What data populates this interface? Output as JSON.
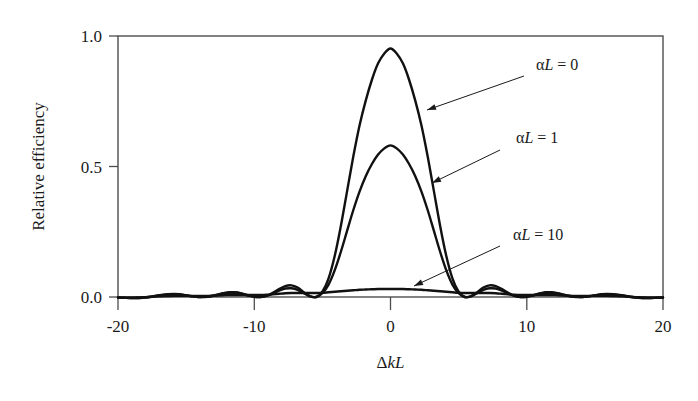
{
  "chart_data": {
    "type": "line",
    "title": "",
    "xlabel": "ΔkL",
    "ylabel": "Relative efficiency",
    "xlim": [
      -20,
      20
    ],
    "ylim": [
      0.0,
      1.05
    ],
    "grid": false,
    "legend_position": "inline-annotations",
    "x_ticks": [
      "-20",
      "-10",
      "0",
      "10",
      "20"
    ],
    "x_tick_values": [
      -20,
      -10,
      0,
      10,
      20
    ],
    "y_ticks": [
      "0.0",
      "0.5",
      "1.0"
    ],
    "y_tick_values": [
      0.0,
      0.5,
      1.0
    ],
    "series": [
      {
        "name": "αL = 0",
        "alpha_L": 0,
        "peak_value": 1.0,
        "peak_x": 0,
        "first_null_x": 6.28,
        "sidelobe_peaks": [
          0.047,
          0.017,
          0.008
        ],
        "description": "sinc^2(ΔkL/2) lossless phase-matching curve",
        "values": [
          -0.002,
          -0.003,
          -0.004,
          -0.004,
          -0.003,
          0.0,
          0.004,
          0.008,
          0.011,
          0.012,
          0.011,
          0.007,
          0.003,
          0.0,
          0.0,
          0.003,
          0.009,
          0.015,
          0.019,
          0.019,
          0.014,
          0.007,
          0.001,
          0.0,
          0.005,
          0.017,
          0.032,
          0.044,
          0.047,
          0.038,
          0.019,
          0.003,
          0.0,
          0.021,
          0.075,
          0.166,
          0.288,
          0.427,
          0.566,
          0.69,
          0.79,
          0.874,
          0.94,
          0.98,
          1.0,
          0.98,
          0.94,
          0.874,
          0.79,
          0.69,
          0.566,
          0.427,
          0.288,
          0.166,
          0.075,
          0.021,
          0.0,
          0.003,
          0.019,
          0.038,
          0.047,
          0.044,
          0.032,
          0.017,
          0.005,
          0.0,
          0.001,
          0.007,
          0.014,
          0.019,
          0.019,
          0.015,
          0.009,
          0.003,
          0.0,
          0.0,
          0.003,
          0.007,
          0.011,
          0.012,
          0.011,
          0.008,
          0.004,
          0.0,
          -0.003,
          -0.004,
          -0.004,
          -0.003,
          -0.002
        ]
      },
      {
        "name": "αL = 1",
        "alpha_L": 1,
        "peak_value": 0.61,
        "peak_x": 0,
        "first_null_x": 6.5,
        "sidelobe_peaks": [
          0.035,
          0.014,
          0.007
        ],
        "description": "moderately absorbing medium, peak reduced to ~0.61",
        "values": [
          -0.002,
          -0.003,
          -0.004,
          -0.004,
          -0.002,
          0.0,
          0.004,
          0.007,
          0.009,
          0.01,
          0.009,
          0.006,
          0.003,
          0.0,
          0.001,
          0.003,
          0.008,
          0.013,
          0.016,
          0.016,
          0.012,
          0.006,
          0.001,
          0.0,
          0.005,
          0.014,
          0.026,
          0.034,
          0.035,
          0.029,
          0.015,
          0.003,
          0.0,
          0.015,
          0.05,
          0.108,
          0.183,
          0.267,
          0.35,
          0.424,
          0.486,
          0.535,
          0.573,
          0.598,
          0.61,
          0.598,
          0.573,
          0.535,
          0.486,
          0.424,
          0.35,
          0.267,
          0.183,
          0.108,
          0.05,
          0.015,
          0.0,
          0.003,
          0.015,
          0.029,
          0.035,
          0.034,
          0.026,
          0.014,
          0.005,
          0.0,
          0.001,
          0.006,
          0.012,
          0.016,
          0.016,
          0.013,
          0.008,
          0.003,
          0.001,
          0.0,
          0.003,
          0.006,
          0.009,
          0.01,
          0.009,
          0.007,
          0.004,
          0.0,
          -0.002,
          -0.004,
          -0.004,
          -0.003,
          -0.002
        ]
      },
      {
        "name": "αL = 10",
        "alpha_L": 10,
        "peak_value": 0.032,
        "peak_x": 0,
        "first_null_x": null,
        "sidelobe_peaks": [],
        "description": "strongly absorbing medium, nearly flat broad response",
        "values": [
          -0.003,
          -0.003,
          -0.003,
          -0.002,
          -0.001,
          0.0,
          0.002,
          0.003,
          0.004,
          0.005,
          0.005,
          0.005,
          0.004,
          0.004,
          0.004,
          0.005,
          0.006,
          0.007,
          0.008,
          0.008,
          0.008,
          0.008,
          0.008,
          0.008,
          0.009,
          0.011,
          0.013,
          0.015,
          0.016,
          0.016,
          0.016,
          0.016,
          0.016,
          0.017,
          0.019,
          0.021,
          0.023,
          0.025,
          0.027,
          0.029,
          0.03,
          0.031,
          0.032,
          0.032,
          0.032,
          0.032,
          0.032,
          0.031,
          0.03,
          0.029,
          0.027,
          0.025,
          0.023,
          0.021,
          0.019,
          0.017,
          0.016,
          0.016,
          0.016,
          0.016,
          0.016,
          0.015,
          0.013,
          0.011,
          0.009,
          0.008,
          0.008,
          0.008,
          0.008,
          0.008,
          0.008,
          0.007,
          0.006,
          0.005,
          0.004,
          0.004,
          0.004,
          0.005,
          0.005,
          0.005,
          0.004,
          0.003,
          0.002,
          0.0,
          -0.001,
          -0.002,
          -0.003,
          -0.003,
          -0.003
        ]
      }
    ],
    "annotations": [
      {
        "id": "annot-alpha-l-0",
        "text_alpha": "α",
        "text_L": "L",
        "text_eq": " = 0",
        "label": "αL = 0",
        "label_x": 536,
        "label_y": 70,
        "leader_from_x": 524,
        "leader_from_y": 76,
        "arrow_to_x": 427,
        "arrow_to_y": 110
      },
      {
        "id": "annot-alpha-l-1",
        "text_alpha": "α",
        "text_L": "L",
        "text_eq": " = 1",
        "label": "αL = 1",
        "label_x": 516,
        "label_y": 143,
        "leader_from_x": 500,
        "leader_from_y": 150,
        "arrow_to_x": 432,
        "arrow_to_y": 183
      },
      {
        "id": "annot-alpha-l-10",
        "text_alpha": "α",
        "text_L": "L",
        "text_eq": " = 10",
        "label": "αL = 10",
        "label_x": 513,
        "label_y": 240,
        "leader_from_x": 500,
        "leader_from_y": 246,
        "arrow_to_x": 414,
        "arrow_to_y": 286
      }
    ],
    "colors": {
      "curve": "#111111",
      "frame": "#4d4d4d",
      "text": "#1a1a1a",
      "background": "#ffffff"
    }
  }
}
